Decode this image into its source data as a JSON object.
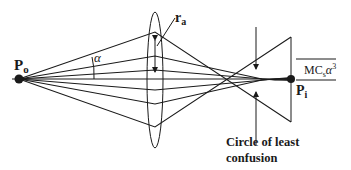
{
  "figure": {
    "type": "spherical-aberration-ray-diagram",
    "labels": {
      "object_point": "P",
      "object_point_sub": "o",
      "image_point": "P",
      "image_point_sub": "i",
      "angle": "α",
      "aperture_radius": "r",
      "aperture_radius_sub": "a",
      "aberration_M": "MC",
      "aberration_sub": "s",
      "aberration_alpha": "α",
      "aberration_exp": "3",
      "circle_line1": "Circle of least",
      "circle_line2": "confusion"
    },
    "ray_count": 7,
    "colors": {
      "ink": "#1a1a1a",
      "background": "#ffffff"
    }
  }
}
